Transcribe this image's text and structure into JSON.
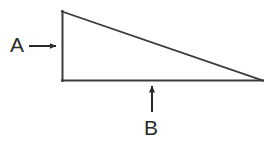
{
  "figure": {
    "background_color": "#ffffff",
    "stroke_color": "#3a3a3a",
    "text_color": "#2b2b2b",
    "canvas": {
      "width": 273,
      "height": 142
    },
    "shape": {
      "name": "right-triangle",
      "vertices": {
        "top_left": {
          "x": 62,
          "y": 11
        },
        "bottom_left": {
          "x": 62,
          "y": 81
        },
        "bottom_right": {
          "x": 262,
          "y": 81
        }
      },
      "sides": {
        "vertical": "left vertical leg",
        "horizontal": "bottom horizontal leg",
        "hypotenuse": "slanted side from top-left to bottom-right"
      },
      "stroke_width": 2
    },
    "annotations": [
      {
        "label": "A",
        "points_to": "vertical-left-side",
        "arrow_direction": "right",
        "label_position": {
          "x": 10,
          "y": 52
        },
        "label_font_size": 21,
        "arrow": {
          "x1": 29,
          "y1": 46,
          "x2": 58,
          "y2": 46
        }
      },
      {
        "label": "B",
        "points_to": "bottom-horizontal-side",
        "arrow_direction": "up",
        "label_position": {
          "x": 144,
          "y": 135
        },
        "label_font_size": 21,
        "arrow": {
          "x1": 152,
          "y1": 112,
          "x2": 152,
          "y2": 84
        }
      }
    ]
  }
}
